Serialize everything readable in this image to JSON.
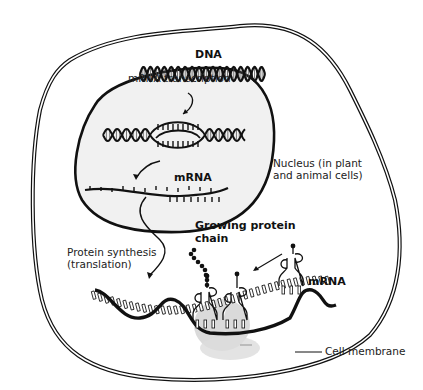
{
  "diagram": {
    "labels": {
      "dna": "DNA",
      "mrna_transcription": "mRNA transcription",
      "nucleus_mrna": "mRNA",
      "nucleus": "Nucleus (in plant\nand animal cells)",
      "protein_synthesis": "Protein synthesis\n(translation)",
      "growing_protein": "Growing protein\nchain",
      "cytoplasm_mrna": "mRNA",
      "cell_membrane": "Cell membrane"
    },
    "colors": {
      "line": "#111111",
      "nucleus_fill": "#f1f1f1",
      "ribosome_shadow": "#cfcfcf"
    }
  }
}
